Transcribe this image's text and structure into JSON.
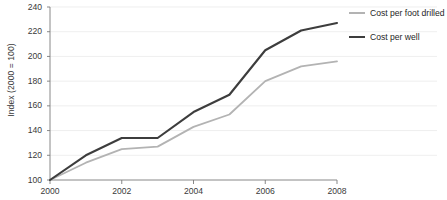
{
  "chart_data": {
    "type": "line",
    "title": "",
    "xlabel": "",
    "ylabel": "Index (2000 = 100)",
    "x": [
      2000,
      2001,
      2002,
      2003,
      2004,
      2005,
      2006,
      2007,
      2008
    ],
    "xlim": [
      2000,
      2008
    ],
    "ylim": [
      100,
      240
    ],
    "xticks": [
      2000,
      2002,
      2004,
      2006,
      2008
    ],
    "xtick_labels": [
      "2000",
      "2002",
      "2004",
      "2006",
      "2008"
    ],
    "yticks": [
      100,
      120,
      140,
      160,
      180,
      200,
      220,
      240
    ],
    "ytick_labels": [
      "100",
      "120",
      "140",
      "160",
      "180",
      "200",
      "220",
      "240"
    ],
    "grid": "horizontal",
    "legend_position": "right",
    "series": [
      {
        "name": "Cost per foot drilled",
        "color": "#b3b3b3",
        "values": [
          100,
          114,
          125,
          127,
          143,
          153,
          180,
          192,
          196
        ]
      },
      {
        "name": "Cost per well",
        "color": "#3d3d3d",
        "values": [
          100,
          120,
          134,
          134,
          155,
          169,
          205,
          221,
          227
        ]
      }
    ]
  },
  "legend": {
    "items": [
      {
        "label": "Cost per foot drilled"
      },
      {
        "label": "Cost per well"
      }
    ]
  },
  "colors": {
    "axis": "#7a7a7a",
    "grid": "#e6e6e6",
    "text": "#3a3a3a",
    "series_light": "#b3b3b3",
    "series_dark": "#3d3d3d"
  }
}
